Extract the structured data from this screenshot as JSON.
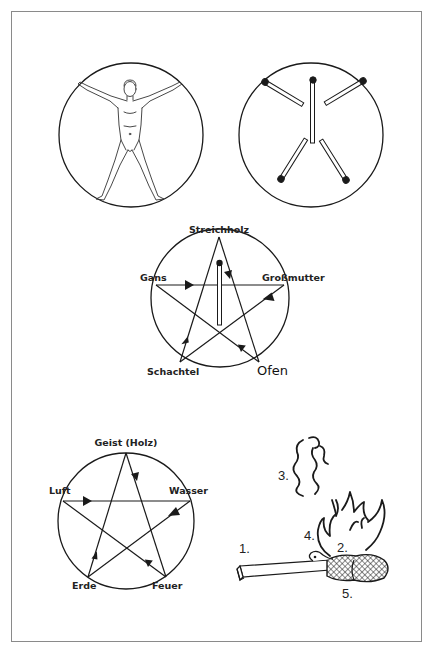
{
  "figure": {
    "panels": [
      {
        "id": "vitruvian",
        "description": "Vitruvian-man figure in a circle"
      },
      {
        "id": "five-matches",
        "description": "Five matchsticks in a circle, heads on the rim (and one at centre top)"
      },
      {
        "id": "pentagram-fairytale",
        "labels": {
          "top": "Streichholz",
          "left": "Gans",
          "right": "Großmutter",
          "bottom_left": "Schachtel",
          "bottom_right": "Ofen"
        }
      },
      {
        "id": "pentagram-elements",
        "labels": {
          "top": "Geist (Holz)",
          "left": "Luft",
          "right": "Wasser",
          "bottom_left": "Erde",
          "bottom_right": "Feuer"
        }
      },
      {
        "id": "burning-match",
        "numbers": [
          "1.",
          "2.",
          "3.",
          "4.",
          "5."
        ]
      }
    ],
    "colors": {
      "line": "#1a1a1a",
      "frame": "#8a8a8a",
      "background": "#ffffff"
    }
  }
}
